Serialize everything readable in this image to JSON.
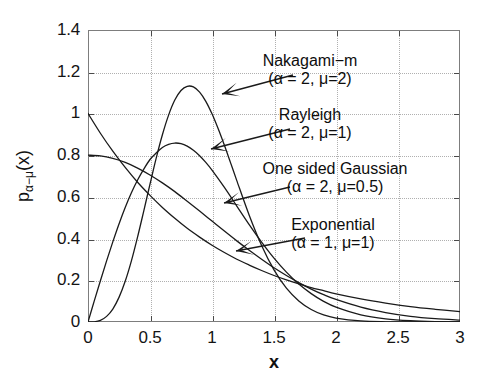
{
  "chart_data": {
    "type": "line",
    "title": "",
    "xlabel": "x",
    "ylabel": "p_{α−μ}(x)",
    "ylabel_base": "p",
    "ylabel_sub": "α−μ",
    "ylabel_tail": "(x)",
    "xlim": [
      0,
      3
    ],
    "ylim": [
      0,
      1.4
    ],
    "grid": true,
    "legend_position": "inline-annotations",
    "xticks": [
      0,
      0.5,
      1,
      1.5,
      2,
      2.5,
      3
    ],
    "xticklabels": [
      "0",
      "0.5",
      "1",
      "1.5",
      "2",
      "2.5",
      "3"
    ],
    "yticks": [
      0,
      0.2,
      0.4,
      0.6,
      0.8,
      1,
      1.2,
      1.4
    ],
    "yticklabels": [
      "0",
      "0.2",
      "0.4",
      "0.6",
      "0.8",
      "1",
      "1.2",
      "1.4"
    ],
    "series": [
      {
        "name": "Nakagami-m",
        "alpha": 2,
        "mu": 2,
        "peak_x": 0.87,
        "peak_y": 1.17,
        "x": [
          0,
          0.05,
          0.1,
          0.15,
          0.2,
          0.25,
          0.3,
          0.35,
          0.4,
          0.45,
          0.5,
          0.55,
          0.6,
          0.65,
          0.7,
          0.75,
          0.8,
          0.85,
          0.9,
          0.95,
          1.0,
          1.05,
          1.1,
          1.15,
          1.2,
          1.3,
          1.4,
          1.5,
          1.6,
          1.7,
          1.8,
          1.9,
          2.0,
          2.2,
          2.4,
          2.6,
          2.8,
          3.0
        ],
        "y": [
          0,
          0.001,
          0.008,
          0.027,
          0.062,
          0.118,
          0.195,
          0.293,
          0.408,
          0.533,
          0.661,
          0.786,
          0.898,
          0.992,
          1.064,
          1.11,
          1.13,
          1.127,
          1.102,
          1.058,
          0.998,
          0.926,
          0.847,
          0.763,
          0.678,
          0.512,
          0.367,
          0.25,
          0.162,
          0.101,
          0.06,
          0.034,
          0.019,
          0.005,
          0.001,
          0.0003,
          0.0001,
          2e-05
        ]
      },
      {
        "name": "Rayleigh",
        "alpha": 2,
        "mu": 1,
        "peak_x": 0.71,
        "peak_y": 0.86,
        "x": [
          0,
          0.05,
          0.1,
          0.15,
          0.2,
          0.25,
          0.3,
          0.35,
          0.4,
          0.45,
          0.5,
          0.55,
          0.6,
          0.65,
          0.7,
          0.75,
          0.8,
          0.85,
          0.9,
          0.95,
          1.0,
          1.1,
          1.2,
          1.3,
          1.4,
          1.5,
          1.6,
          1.7,
          1.8,
          1.9,
          2.0,
          2.2,
          2.4,
          2.6,
          2.8,
          3.0
        ],
        "y": [
          0,
          0.1,
          0.198,
          0.293,
          0.384,
          0.47,
          0.549,
          0.62,
          0.681,
          0.733,
          0.779,
          0.81,
          0.837,
          0.852,
          0.858,
          0.855,
          0.843,
          0.823,
          0.797,
          0.765,
          0.728,
          0.645,
          0.556,
          0.467,
          0.383,
          0.306,
          0.239,
          0.182,
          0.136,
          0.099,
          0.071,
          0.034,
          0.015,
          0.006,
          0.002,
          0.0008
        ]
      },
      {
        "name": "One sided Gaussian",
        "alpha": 2,
        "mu": 0.5,
        "peak_x": 0.0,
        "peak_y": 0.8,
        "x": [
          0,
          0.1,
          0.2,
          0.3,
          0.4,
          0.5,
          0.6,
          0.7,
          0.8,
          0.9,
          1.0,
          1.1,
          1.2,
          1.3,
          1.4,
          1.5,
          1.6,
          1.7,
          1.8,
          1.9,
          2.0,
          2.2,
          2.4,
          2.6,
          2.8,
          3.0
        ],
        "y": [
          0.8,
          0.796,
          0.784,
          0.765,
          0.738,
          0.705,
          0.667,
          0.625,
          0.579,
          0.532,
          0.484,
          0.436,
          0.389,
          0.344,
          0.301,
          0.26,
          0.223,
          0.189,
          0.158,
          0.131,
          0.108,
          0.071,
          0.045,
          0.027,
          0.016,
          0.009
        ]
      },
      {
        "name": "Exponential",
        "alpha": 1,
        "mu": 1,
        "peak_x": 0.0,
        "peak_y": 1.0,
        "x": [
          0,
          0.1,
          0.2,
          0.3,
          0.4,
          0.5,
          0.6,
          0.7,
          0.8,
          0.9,
          1.0,
          1.1,
          1.2,
          1.3,
          1.4,
          1.5,
          1.6,
          1.7,
          1.8,
          1.9,
          2.0,
          2.2,
          2.4,
          2.6,
          2.8,
          3.0
        ],
        "y": [
          1.0,
          0.905,
          0.819,
          0.741,
          0.67,
          0.607,
          0.549,
          0.497,
          0.449,
          0.407,
          0.368,
          0.333,
          0.301,
          0.273,
          0.247,
          0.223,
          0.202,
          0.183,
          0.165,
          0.15,
          0.135,
          0.111,
          0.091,
          0.074,
          0.061,
          0.05
        ]
      }
    ],
    "annotations": [
      {
        "line1": "Nakagami−m",
        "line2": "(α = 2, μ=2)",
        "text_x": 310,
        "text_y": 52,
        "arrow_from_x": 293,
        "arrow_from_y": 75,
        "arrow_to_x": 222,
        "arrow_to_y": 94
      },
      {
        "line1": "Rayleigh",
        "line2": "(α = 2, μ=1)",
        "text_x": 310,
        "text_y": 106,
        "arrow_from_x": 290,
        "arrow_from_y": 129,
        "arrow_to_x": 211,
        "arrow_to_y": 149
      },
      {
        "line1": "One sided Gaussian",
        "line2": "(α = 2, μ=0.5)",
        "text_x": 335,
        "text_y": 160,
        "arrow_from_x": 290,
        "arrow_from_y": 187,
        "arrow_to_x": 224,
        "arrow_to_y": 203
      },
      {
        "line1": "Exponential",
        "line2": "(α = 1, μ=1)",
        "text_x": 333,
        "text_y": 216,
        "arrow_from_x": 305,
        "arrow_from_y": 238,
        "arrow_to_x": 236,
        "arrow_to_y": 251
      }
    ],
    "colors": {
      "curve": "#1a1a1a",
      "axis": "#7d7d7d",
      "grid": "#b0b0b0",
      "text": "#111111",
      "background": "#ffffff"
    }
  }
}
